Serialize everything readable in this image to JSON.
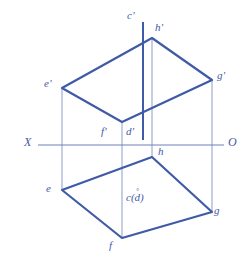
{
  "figure": {
    "type": "descriptive-geometry-projection",
    "colors": {
      "outline": "#3f5aa6",
      "projector": "#8e9dc9",
      "axis": "#6d80b8",
      "background": "#ffffff"
    },
    "stroke_widths": {
      "outline": 2.2,
      "projector": 1.0,
      "axis": 1.0,
      "vertical_line": 2.0
    }
  },
  "axis": {
    "x_label": "X",
    "o_label": "O",
    "y": 145,
    "x_start": 38,
    "x_end": 224
  },
  "front_view": {
    "name": "frontal-projection",
    "vertices": [
      {
        "id": "e-prime",
        "label": "e'",
        "x": 62,
        "y": 88,
        "label_x": 44,
        "label_y": 78
      },
      {
        "id": "h-prime",
        "label": "h'",
        "x": 152,
        "y": 38,
        "label_x": 155,
        "label_y": 22
      },
      {
        "id": "g-prime",
        "label": "g'",
        "x": 212,
        "y": 80,
        "label_x": 217,
        "label_y": 70
      },
      {
        "id": "f-prime",
        "label": "f'",
        "x": 122,
        "y": 122,
        "label_x": 101,
        "label_y": 126
      }
    ],
    "extra_labels": [
      {
        "id": "d-prime",
        "label": "d'",
        "label_x": 126,
        "label_y": 126
      },
      {
        "id": "c-prime",
        "label": "c'",
        "label_x": 127,
        "label_y": 10
      }
    ],
    "vertical_line": {
      "id": "cd-line",
      "x": 143,
      "y_top": 22,
      "y_bottom": 140
    }
  },
  "top_view": {
    "name": "horizontal-projection",
    "vertices": [
      {
        "id": "e",
        "label": "e",
        "x": 62,
        "y": 190,
        "label_x": 46,
        "label_y": 183
      },
      {
        "id": "h",
        "label": "h",
        "x": 152,
        "y": 157,
        "label_x": 158,
        "label_y": 146
      },
      {
        "id": "g",
        "label": "g",
        "x": 212,
        "y": 212,
        "label_x": 214,
        "label_y": 205
      },
      {
        "id": "f",
        "label": "f",
        "x": 122,
        "y": 238,
        "label_x": 109,
        "label_y": 240
      }
    ],
    "coincident_point": {
      "id": "c-d",
      "label": "c(d)",
      "label_x": 126,
      "label_y": 192,
      "marker": "°"
    }
  },
  "projectors": [
    {
      "id": "projector-e",
      "x": 62,
      "y_top": 88,
      "y_bottom": 190
    },
    {
      "id": "projector-h",
      "x": 152,
      "y_top": 38,
      "y_bottom": 157
    },
    {
      "id": "projector-g",
      "x": 212,
      "y_top": 80,
      "y_bottom": 212
    },
    {
      "id": "projector-f",
      "x": 122,
      "y_top": 122,
      "y_bottom": 238
    }
  ]
}
